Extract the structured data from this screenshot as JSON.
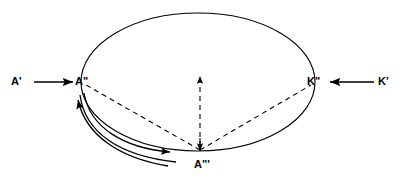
{
  "figure": {
    "title": "",
    "background_color": "#ffffff",
    "stroke_color": "#000000",
    "labels": {
      "a_prime": "A'",
      "a_double_prime": "A\"",
      "a_triple_prime": "A\"'",
      "k_prime": "K'",
      "k_double_prime": "K\""
    },
    "nodes": [
      {
        "id": "a-prime",
        "label": "A'",
        "x": 18,
        "y": 86
      },
      {
        "id": "a-double-prime",
        "label": "A\"",
        "x": 78,
        "y": 86
      },
      {
        "id": "a-triple-prime",
        "label": "A\"'",
        "x": 200,
        "y": 166
      },
      {
        "id": "k-double-prime",
        "label": "K\"",
        "x": 313,
        "y": 86
      },
      {
        "id": "k-prime",
        "label": "K'",
        "x": 383,
        "y": 86
      }
    ],
    "shapes": {
      "ellipse": {
        "cx": 198,
        "cy": 82,
        "rx": 117,
        "ry": 69
      }
    },
    "edges": [
      {
        "id": "a-prime-to-a-double-prime",
        "style": "solid",
        "arrow": "end",
        "from": "A'",
        "to": "A\""
      },
      {
        "id": "k-prime-to-k-double-prime",
        "style": "solid",
        "arrow": "end",
        "from": "K'",
        "to": "K\""
      },
      {
        "id": "a-triple-prime-to-a-double-prime",
        "style": "dashed",
        "arrow": "none",
        "from": "A\"'",
        "to": "A\""
      },
      {
        "id": "a-triple-prime-vertical",
        "style": "dashed",
        "arrow": "both",
        "from": "A\"'",
        "to": "up"
      },
      {
        "id": "a-triple-prime-to-k-double-prime",
        "style": "dashed",
        "arrow": "none",
        "from": "A\"'",
        "to": "K\""
      },
      {
        "id": "arc-return-to-a-double-prime",
        "style": "solid",
        "arrow": "start",
        "from": "A\"'",
        "to": "A\""
      },
      {
        "id": "arc-outbound-1",
        "style": "solid",
        "arrow": "end",
        "from": "A\"",
        "to": "A\"'"
      },
      {
        "id": "arc-outbound-2",
        "style": "solid",
        "arrow": "end",
        "from": "A\"",
        "to": "A\"'"
      }
    ]
  }
}
